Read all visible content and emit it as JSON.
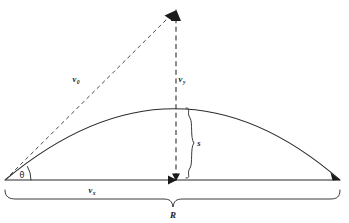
{
  "figure": {
    "background_color": "#ffffff",
    "ink_color": "#1a1a1a"
  },
  "labels": {
    "v0": {
      "symbol": "v",
      "subscript": "0",
      "name": "initial-velocity"
    },
    "vy": {
      "symbol": "v",
      "subscript": "y",
      "name": "vertical-velocity-component"
    },
    "vx": {
      "symbol": "v",
      "subscript": "x",
      "name": "horizontal-velocity-component"
    },
    "theta": {
      "symbol": "θ",
      "name": "launch-angle"
    },
    "s": {
      "symbol": "s",
      "name": "maximum-height"
    },
    "R": {
      "symbol": "R",
      "name": "range"
    }
  },
  "geometry": {
    "origin": {
      "x": 5,
      "y": 180
    },
    "landing": {
      "x": 340,
      "y": 180
    },
    "apex": {
      "x": 176,
      "y": 108
    },
    "vector_tip": {
      "x": 176,
      "y": 10
    },
    "baseline_y": 180,
    "range_brace_y": 196,
    "height_brace_x": 190
  },
  "label_positions": {
    "v0": {
      "x": 76,
      "y": 82
    },
    "vy": {
      "x": 182,
      "y": 82
    },
    "vx": {
      "x": 92,
      "y": 193
    },
    "theta": {
      "x": 22,
      "y": 178
    },
    "s": {
      "x": 199,
      "y": 146
    },
    "R": {
      "x": 173,
      "y": 218
    }
  }
}
